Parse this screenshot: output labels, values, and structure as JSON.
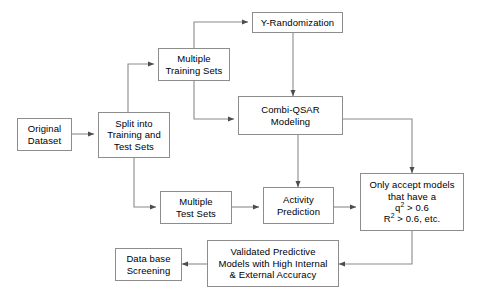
{
  "diagram": {
    "background_color": "#ffffff",
    "node_border_color": "#8d8d8d",
    "node_fill_color": "#ffffff",
    "edge_color": "#4d4d4d",
    "text_color": "#000000",
    "nodes": [
      {
        "id": "original_dataset",
        "label": "Original\nDataset"
      },
      {
        "id": "split",
        "label": "Split into\nTraining and\nTest Sets"
      },
      {
        "id": "training_sets",
        "label": "Multiple\nTraining Sets"
      },
      {
        "id": "y_randomization",
        "label": "Y-Randomization"
      },
      {
        "id": "combi_qsar",
        "label": "Combi-QSAR\nModeling"
      },
      {
        "id": "test_sets",
        "label": "Multiple\nTest Sets"
      },
      {
        "id": "activity_pred",
        "label": "Activity\nPrediction"
      },
      {
        "id": "accept_models",
        "label": "Only accept models\nthat have a"
      },
      {
        "id": "accept_models_q2",
        "label": "q2 > 0.6"
      },
      {
        "id": "accept_models_r2",
        "label": "R2 > 0.6, etc."
      },
      {
        "id": "validated_models",
        "label": "Validated Predictive\nModels with High Internal\n& External Accuracy"
      },
      {
        "id": "database_screening",
        "label": "Data base\nScreening"
      }
    ],
    "edges": [
      {
        "from": "original_dataset",
        "to": "split"
      },
      {
        "from": "split",
        "to": "training_sets"
      },
      {
        "from": "split",
        "to": "test_sets"
      },
      {
        "from": "training_sets",
        "to": "y_randomization"
      },
      {
        "from": "training_sets",
        "to": "combi_qsar"
      },
      {
        "from": "y_randomization",
        "to": "combi_qsar"
      },
      {
        "from": "combi_qsar",
        "to": "activity_pred"
      },
      {
        "from": "combi_qsar",
        "to": "accept_models"
      },
      {
        "from": "test_sets",
        "to": "activity_pred"
      },
      {
        "from": "activity_pred",
        "to": "accept_models"
      },
      {
        "from": "accept_models",
        "to": "validated_models"
      },
      {
        "from": "validated_models",
        "to": "database_screening"
      }
    ]
  }
}
